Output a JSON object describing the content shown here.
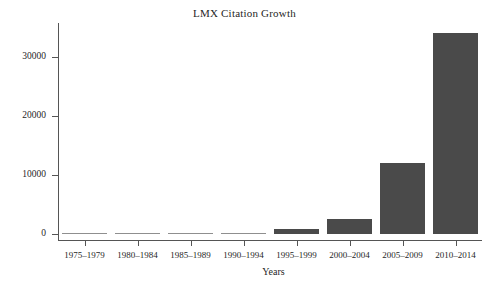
{
  "chart_data": {
    "type": "bar",
    "title": "LMX Citation Growth",
    "xlabel": "Years",
    "ylabel": "Citations",
    "categories": [
      "1975–1979",
      "1980–1984",
      "1985–1989",
      "1990–1994",
      "1995–1999",
      "2000–2004",
      "2005–2009",
      "2010–2014"
    ],
    "values": [
      0,
      50,
      80,
      150,
      800,
      2500,
      12000,
      34000
    ],
    "ylim": [
      0,
      34000
    ],
    "yticks": [
      0,
      10000,
      20000,
      30000
    ],
    "ytick_labels": [
      "0",
      "10000",
      "20000",
      "30000"
    ],
    "grid": false,
    "legend": false,
    "series_color": "#4a4a4a",
    "axis_color": "#555555",
    "background": "#ffffff"
  }
}
